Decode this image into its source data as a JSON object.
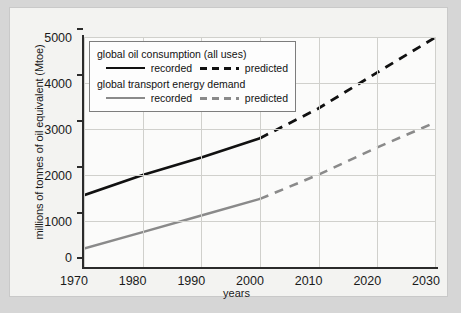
{
  "chart_data": {
    "type": "line",
    "title": "",
    "xlabel": "years",
    "ylabel": "millions of tonnes of oil equivalent (Mtoe)",
    "xlim": [
      1970,
      2030
    ],
    "ylim": [
      0,
      5000
    ],
    "xticks": [
      "1970",
      "1980",
      "1990",
      "2000",
      "2010",
      "2020",
      "2030"
    ],
    "yticks": [
      "0",
      "1000",
      "2000",
      "3000",
      "4000",
      "5000"
    ],
    "grid": true,
    "legend_position": "upper left",
    "series": [
      {
        "name": "global oil consumption (all uses) - recorded",
        "style": "solid",
        "color": "#111111",
        "x": [
          1970,
          1980,
          1990,
          2000
        ],
        "values": [
          1560,
          2000,
          2380,
          2800
        ]
      },
      {
        "name": "global oil consumption (all uses) - predicted",
        "style": "dashed",
        "color": "#111111",
        "x": [
          2000,
          2010,
          2020,
          2030
        ],
        "values": [
          2800,
          3450,
          4230,
          5000
        ]
      },
      {
        "name": "global transport energy demand - recorded",
        "style": "solid",
        "color": "#8a8a8a",
        "x": [
          1970,
          1980,
          1990,
          2000
        ],
        "values": [
          400,
          760,
          1120,
          1480
        ]
      },
      {
        "name": "global transport energy demand - predicted",
        "style": "dashed",
        "color": "#8a8a8a",
        "x": [
          2000,
          2010,
          2020,
          2030
        ],
        "values": [
          1480,
          2010,
          2600,
          3150
        ]
      }
    ]
  },
  "legend": {
    "group1_title": "global oil consumption (all uses)",
    "group1_recorded": "recorded",
    "group1_predicted": "predicted",
    "group2_title": "global transport energy demand",
    "group2_recorded": "recorded",
    "group2_predicted": "predicted"
  },
  "axes": {
    "ylabel": "millions of tonnes of oil equivalent (Mtoe)",
    "xlabel": "years",
    "yticks": [
      "5000",
      "4000",
      "3000",
      "2000",
      "1000",
      "0"
    ],
    "xticks": [
      "1970",
      "1980",
      "1990",
      "2000",
      "2010",
      "2020",
      "2030"
    ]
  },
  "colors": {
    "oil_line": "#111111",
    "transport_line": "#8a8a8a",
    "background": "#d6d6d6",
    "panel": "#f3f3f1",
    "plot": "#fbfbfa",
    "grid": "#d0d0cc"
  }
}
